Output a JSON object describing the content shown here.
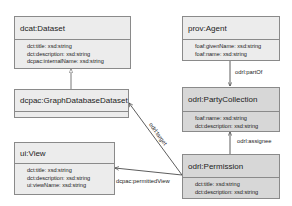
{
  "classes": {
    "dataset": {
      "name": "dcat:Dataset",
      "attributes": [
        "dct:title: xsd:string",
        "dct:description: xsd:string",
        "dcpac:internalName: xsd:string"
      ]
    },
    "graph_dataset": {
      "name": "dcpac:GraphDatabaseDataset",
      "attributes": []
    },
    "ui_view": {
      "name": "ui:View",
      "attributes": [
        "dct:title: xsd:string",
        "dct:description: xsd:string",
        "ui:viewName: xsd:string"
      ]
    },
    "agent": {
      "name": "prov:Agent",
      "attributes": [
        "foaf:givenName: xsd:string",
        "foaf:name: xsd:string"
      ]
    },
    "party_collection": {
      "name": "odrl:PartyCollection",
      "attributes": [
        "foaf:name: xsd:string",
        "dct:description: xsd:string"
      ]
    },
    "permission": {
      "name": "odrl:Permission",
      "attributes": [
        "dct:title: xsd:string",
        "dct:description: xsd:string"
      ]
    }
  },
  "relations": {
    "part_of": "odrl:partOf",
    "assignee": "odrl:assignee",
    "target": "odrl:target",
    "permitted_view": "dcpac:permittedView"
  },
  "colors": {
    "light_box": "#ececec",
    "dark_box": "#d7d7d7",
    "border": "#8a8a8a"
  }
}
